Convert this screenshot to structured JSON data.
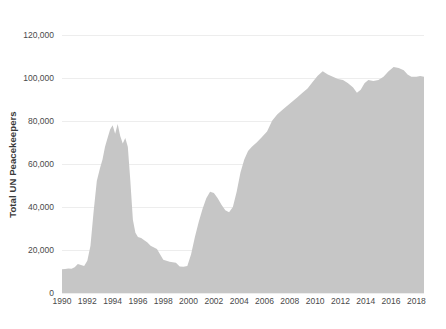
{
  "chart_data": {
    "type": "area",
    "title": "",
    "xlabel": "",
    "ylabel": "Total UN Peacekeepers",
    "xlim": [
      1990,
      2018.6
    ],
    "ylim": [
      0,
      125000
    ],
    "grid": true,
    "legend": null,
    "series_name": "Total UN Peacekeepers",
    "fill_color": "#c6c6c6",
    "grid_color": "#ededed",
    "background_color": "#ffffff",
    "text_color": "#4a4a4a",
    "y_ticks": [
      0,
      20000,
      40000,
      60000,
      80000,
      100000,
      120000
    ],
    "y_tick_labels": [
      "0",
      "20,000",
      "40,000",
      "60,000",
      "80,000",
      "100,000",
      "120,000"
    ],
    "x_ticks": [
      1990,
      1992,
      1994,
      1996,
      1998,
      2000,
      2002,
      2004,
      2006,
      2008,
      2010,
      2012,
      2014,
      2016,
      2018
    ],
    "x_tick_labels": [
      "1990",
      "1992",
      "1994",
      "1996",
      "1998",
      "2000",
      "2002",
      "2004",
      "2006",
      "2008",
      "2010",
      "2012",
      "2014",
      "2016",
      "2018"
    ],
    "x": [
      1990.0,
      1990.25,
      1990.5,
      1990.75,
      1991.0,
      1991.25,
      1991.5,
      1991.75,
      1992.0,
      1992.25,
      1992.5,
      1992.75,
      1993.0,
      1993.2,
      1993.4,
      1993.6,
      1993.8,
      1994.0,
      1994.2,
      1994.4,
      1994.6,
      1994.8,
      1995.0,
      1995.2,
      1995.4,
      1995.6,
      1995.8,
      1996.0,
      1996.25,
      1996.5,
      1996.75,
      1997.0,
      1997.5,
      1998.0,
      1998.5,
      1999.0,
      1999.3,
      1999.6,
      1999.9,
      2000.2,
      2000.5,
      2000.8,
      2001.1,
      2001.4,
      2001.7,
      2002.0,
      2002.3,
      2002.6,
      2002.9,
      2003.2,
      2003.5,
      2003.8,
      2004.1,
      2004.4,
      2004.7,
      2005.0,
      2005.4,
      2005.8,
      2006.2,
      2006.6,
      2007.0,
      2007.4,
      2007.8,
      2008.2,
      2008.6,
      2009.0,
      2009.4,
      2009.8,
      2010.2,
      2010.6,
      2011.0,
      2011.4,
      2011.8,
      2012.2,
      2012.6,
      2013.0,
      2013.3,
      2013.6,
      2013.9,
      2014.2,
      2014.6,
      2015.0,
      2015.4,
      2015.8,
      2016.2,
      2016.6,
      2017.0,
      2017.3,
      2017.6,
      2018.0,
      2018.3,
      2018.6
    ],
    "y": [
      11000,
      11200,
      11400,
      11300,
      12000,
      13500,
      13000,
      12500,
      15000,
      22000,
      38000,
      52000,
      58000,
      62000,
      68000,
      72000,
      76000,
      78000,
      74000,
      78500,
      73000,
      69500,
      72000,
      68000,
      52000,
      34000,
      28000,
      26000,
      25500,
      24500,
      23500,
      22000,
      20500,
      15500,
      14500,
      14000,
      12300,
      12200,
      12500,
      18000,
      26000,
      33000,
      39000,
      44000,
      47000,
      46500,
      44000,
      41000,
      38500,
      37500,
      40000,
      47000,
      56000,
      62000,
      66000,
      68000,
      70000,
      72500,
      75000,
      80000,
      83000,
      85000,
      87000,
      89000,
      91000,
      93000,
      95000,
      98000,
      101000,
      103000,
      101500,
      100500,
      99500,
      99000,
      97500,
      95500,
      93000,
      94500,
      97500,
      99000,
      98500,
      99000,
      100500,
      103000,
      105000,
      104500,
      103500,
      101500,
      100500,
      100500,
      100800,
      100500
    ]
  }
}
